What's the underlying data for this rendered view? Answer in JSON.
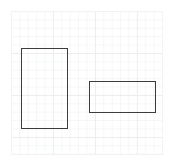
{
  "app": {
    "background_color": "#ffffff"
  },
  "canvas": {
    "name": "drawing-canvas",
    "background_color": "#ffffff",
    "grid": {
      "visible": true,
      "minor_spacing_px": 8.4,
      "major_spacing_px": 42,
      "minor_color": "#f5f6f7",
      "major_color": "#eceef0"
    },
    "border_color": "#f2f3f4",
    "x": 11,
    "y": 11,
    "width": 152,
    "height": 144
  },
  "shapes": [
    {
      "id": "tall-rect",
      "type": "rectangle",
      "label": "",
      "stroke_color": "#3c3c3c",
      "stroke_width_px": 1,
      "fill": "none",
      "x": 21,
      "y": 48,
      "width": 47,
      "height": 81
    },
    {
      "id": "wide-rect",
      "type": "rectangle",
      "label": "",
      "stroke_color": "#3c3c3c",
      "stroke_width_px": 1,
      "fill": "none",
      "x": 89,
      "y": 81,
      "width": 67,
      "height": 32
    }
  ]
}
